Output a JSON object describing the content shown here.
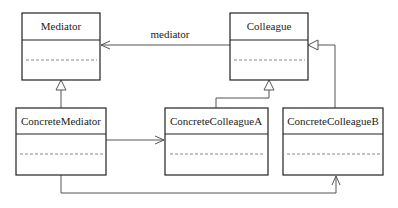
{
  "diagram": {
    "type": "uml-class-diagram",
    "classes": [
      {
        "id": "mediator",
        "name": "Mediator"
      },
      {
        "id": "colleague",
        "name": "Colleague"
      },
      {
        "id": "concrete_mediator",
        "name": "ConcreteMediator"
      },
      {
        "id": "concrete_colleague_a",
        "name": "ConcreteColleagueA"
      },
      {
        "id": "concrete_colleague_b",
        "name": "ConcreteColleagueB"
      }
    ],
    "relationships": [
      {
        "from": "colleague",
        "to": "mediator",
        "kind": "association",
        "label": "mediator"
      },
      {
        "from": "concrete_mediator",
        "to": "mediator",
        "kind": "generalization",
        "label": ""
      },
      {
        "from": "concrete_colleague_a",
        "to": "colleague",
        "kind": "generalization",
        "label": ""
      },
      {
        "from": "concrete_colleague_b",
        "to": "colleague",
        "kind": "generalization",
        "label": ""
      },
      {
        "from": "concrete_mediator",
        "to": "concrete_colleague_a",
        "kind": "association",
        "label": ""
      },
      {
        "from": "concrete_mediator",
        "to": "concrete_colleague_b",
        "kind": "association",
        "label": ""
      }
    ],
    "association_label": "mediator"
  }
}
